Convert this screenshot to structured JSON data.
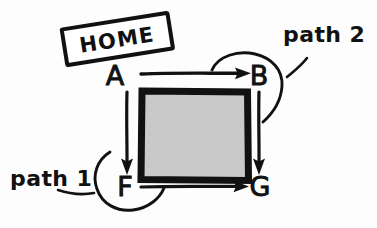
{
  "diagram": {
    "title": "HOME",
    "background_color": "#fdfdfd",
    "ink_color": "#111111",
    "style": "hand-drawn sketch",
    "home_tag": {
      "text": "HOME",
      "rotation_degrees": -9,
      "box_fill": "#ffffff",
      "box_stroke": "#111111"
    },
    "center_region": {
      "name": "shaded-area",
      "fill_color": "#c9c9c9",
      "border_color": "#111111",
      "label": ""
    },
    "nodes": [
      {
        "id": "A",
        "label": "A",
        "x": 124,
        "y": 81
      },
      {
        "id": "B",
        "label": "B",
        "x": 258,
        "y": 81
      },
      {
        "id": "F",
        "label": "F",
        "x": 124,
        "y": 192
      },
      {
        "id": "G",
        "label": "G",
        "x": 258,
        "y": 192
      }
    ],
    "edges": [
      {
        "from": "A",
        "to": "B",
        "direction": "right",
        "label": ""
      },
      {
        "from": "A",
        "to": "F",
        "direction": "down",
        "label": ""
      },
      {
        "from": "B",
        "to": "G",
        "direction": "down",
        "label": ""
      },
      {
        "from": "F",
        "to": "G",
        "direction": "right",
        "label": ""
      }
    ],
    "annotations": [
      {
        "id": "path1",
        "label": "path 1",
        "target_node": "F",
        "marker": "arc-around-node",
        "x": 12,
        "y": 173
      },
      {
        "id": "path2",
        "label": "path 2",
        "target_node": "B",
        "marker": "arc-around-node",
        "x": 283,
        "y": 35
      }
    ]
  }
}
